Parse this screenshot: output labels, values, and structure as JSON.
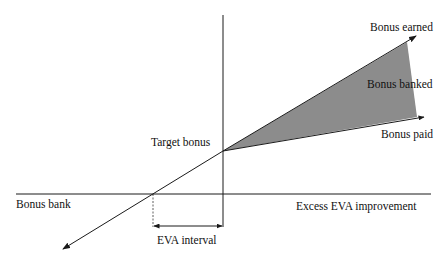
{
  "diagram": {
    "type": "EVA bonus bank diagram",
    "labels": {
      "bonus_earned": "Bonus earned",
      "bonus_banked": "Bonus banked",
      "bonus_paid": "Bonus paid",
      "target_bonus": "Target bonus",
      "bonus_bank": "Bonus bank",
      "x_axis": "Excess EVA improvement",
      "eva_interval": "EVA interval"
    },
    "colors": {
      "line": "#1a1a1a",
      "shaded_region": "#8c8c8c",
      "background": "#ffffff"
    },
    "geometry": {
      "origin": [
        223,
        151
      ],
      "vertical_axis_x": 223,
      "horizontal_axis_y": 194,
      "bonus_earned_tip": [
        416,
        36
      ],
      "bonus_paid_tip": [
        424,
        117
      ],
      "lower_arrow_tip": [
        63,
        249
      ],
      "eva_interval_start_x": 153,
      "eva_interval_end_x": 223
    }
  }
}
